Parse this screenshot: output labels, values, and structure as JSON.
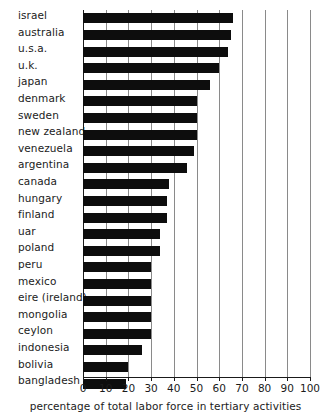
{
  "chart_data": {
    "type": "bar",
    "orientation": "horizontal",
    "title": "",
    "xlabel": "percentage of total labor force in tertiary activities",
    "ylabel": "",
    "xlim": [
      0,
      100
    ],
    "xticks": [
      0,
      10,
      20,
      30,
      40,
      50,
      60,
      70,
      80,
      90,
      100
    ],
    "xtick_labels": [
      "0",
      "10",
      "20",
      "30",
      "40",
      "50",
      "60",
      "70",
      "80",
      "90",
      "100"
    ],
    "grid": true,
    "legend": null,
    "bar_color": "#0d0d0d",
    "grid_color": "#8a8a8a",
    "axis_color": "#1a1a1a",
    "categories": [
      "israel",
      "australia",
      "u.s.a.",
      "u.k.",
      "japan",
      "denmark",
      "sweden",
      "new zealand",
      "venezuela",
      "argentina",
      "canada",
      "hungary",
      "finland",
      "uar",
      "poland",
      "peru",
      "mexico",
      "eire (ireland)",
      "mongolia",
      "ceylon",
      "indonesia",
      "bolivia",
      "bangladesh"
    ],
    "values": [
      66,
      65,
      64,
      60,
      56,
      50,
      50,
      50,
      49,
      46,
      38,
      37,
      37,
      34,
      34,
      30,
      30,
      30,
      30,
      30,
      26,
      20,
      19
    ]
  }
}
